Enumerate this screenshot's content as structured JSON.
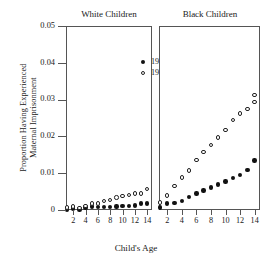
{
  "chart_data": {
    "type": "scatter",
    "title": "",
    "xlabel": "Child's Age",
    "ylabel_line1": "Proportion Having Experienced",
    "ylabel_line2": "Maternal Imprisonment",
    "ylim": [
      0,
      0.05
    ],
    "xlim": [
      1,
      14.6
    ],
    "yticks": [
      0,
      0.01,
      0.02,
      0.03,
      0.04,
      0.05
    ],
    "ytick_labels": [
      "0",
      "0.01",
      "0.02",
      "0.03",
      "0.04",
      "0.05"
    ],
    "xticks": [
      2,
      4,
      6,
      8,
      10,
      12,
      14
    ],
    "xtick_labels": [
      "2",
      "4",
      "6",
      "8",
      "10",
      "12",
      "14"
    ],
    "grid": false,
    "legend_position": "top-left of first panel",
    "legend": [
      {
        "label": "1978",
        "marker": "filled-circle"
      },
      {
        "label": "1990",
        "marker": "open-circle"
      }
    ],
    "panels": [
      {
        "title": "White Children",
        "x": [
          1,
          2,
          3,
          4,
          5,
          6,
          7,
          8,
          9,
          10,
          11,
          12,
          13,
          14
        ],
        "series": [
          {
            "name": "1978",
            "marker": "filled-circle",
            "values": [
              0.0003,
              0.0007,
              0.0004,
              0.001,
              0.0012,
              0.0011,
              0.0011,
              0.0011,
              0.0012,
              0.0013,
              0.0014,
              0.0015,
              0.002,
              0.002
            ]
          },
          {
            "name": "1990",
            "marker": "open-circle",
            "values": [
              0.001,
              0.0012,
              0.0008,
              0.0014,
              0.002,
              0.002,
              0.0028,
              0.003,
              0.0037,
              0.004,
              0.0044,
              0.0048,
              0.0048,
              0.006
            ]
          }
        ]
      },
      {
        "title": "Black Children",
        "x": [
          1,
          2,
          3,
          4,
          5,
          6,
          7,
          8,
          9,
          10,
          11,
          12,
          13,
          14
        ],
        "series": [
          {
            "name": "1978",
            "marker": "filled-circle",
            "values": [
              0.001,
              0.002,
              0.0021,
              0.0028,
              0.0038,
              0.0048,
              0.0056,
              0.0064,
              0.0072,
              0.008,
              0.009,
              0.0098,
              0.0112,
              0.0137
            ]
          },
          {
            "name": "1990",
            "marker": "open-circle",
            "values": [
              0.0023,
              0.0042,
              0.0068,
              0.0091,
              0.011,
              0.0139,
              0.016,
              0.018,
              0.02,
              0.022,
              0.0248,
              0.0265,
              0.0277,
              0.0297,
              0.0315
            ]
          }
        ]
      }
    ]
  }
}
